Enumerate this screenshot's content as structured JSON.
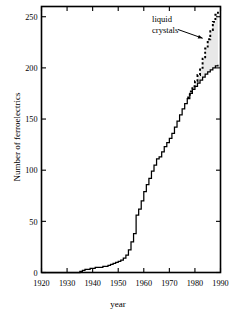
{
  "figure": {
    "ylabel": "Number of ferroelectrics",
    "xlabel": "year"
  },
  "annotations": {
    "liquid_crystals_line1": "liquid",
    "liquid_crystals_line2": "crystals"
  },
  "chart_data": {
    "type": "line",
    "title": "",
    "xlabel": "year",
    "ylabel": "Number of ferroelectrics",
    "xlim": [
      1920,
      1990
    ],
    "ylim": [
      0,
      260
    ],
    "xticks": [
      1920,
      1930,
      1940,
      1950,
      1960,
      1970,
      1980,
      1990
    ],
    "xtick_labels": [
      "1920",
      "1930",
      "1940",
      "1950",
      "1960",
      "1970",
      "1980",
      "1990"
    ],
    "yticks": [
      0,
      50,
      100,
      150,
      200,
      250
    ],
    "ytick_labels": [
      "0",
      "50",
      "100",
      "150",
      "200",
      "250"
    ],
    "grid": false,
    "legend": false,
    "tick_direction": "in",
    "step_style": "post",
    "shaded_region": {
      "between": [
        "ferroelectrics",
        "ferroelectrics_plus_liquid_crystals"
      ],
      "color": "#e8e8e8",
      "from_year": 1977
    },
    "series": [
      {
        "name": "ferroelectrics",
        "style": "solid",
        "color": "#000000",
        "x": [
          1920,
          1934,
          1935,
          1936,
          1937,
          1938,
          1939,
          1940,
          1941,
          1942,
          1943,
          1944,
          1945,
          1946,
          1947,
          1948,
          1949,
          1950,
          1951,
          1952,
          1953,
          1954,
          1955,
          1956,
          1957,
          1958,
          1959,
          1960,
          1961,
          1962,
          1963,
          1964,
          1965,
          1966,
          1967,
          1968,
          1969,
          1970,
          1971,
          1972,
          1973,
          1974,
          1975,
          1976,
          1977,
          1978,
          1979,
          1980,
          1981,
          1982,
          1983,
          1984,
          1985,
          1986,
          1987,
          1988,
          1989
        ],
        "values": [
          0,
          0,
          1,
          2,
          3,
          3,
          4,
          4,
          5,
          5,
          5,
          6,
          6,
          7,
          8,
          9,
          10,
          11,
          12,
          14,
          17,
          22,
          30,
          38,
          56,
          62,
          70,
          79,
          86,
          92,
          99,
          105,
          111,
          113,
          118,
          123,
          127,
          131,
          136,
          142,
          148,
          154,
          160,
          165,
          170,
          175,
          179,
          182,
          185,
          188,
          191,
          194,
          196,
          198,
          200,
          202,
          203
        ]
      },
      {
        "name": "ferroelectrics_plus_liquid_crystals",
        "style": "dotted",
        "color": "#000000",
        "x": [
          1977,
          1978,
          1979,
          1980,
          1981,
          1982,
          1983,
          1984,
          1985,
          1986,
          1987,
          1988,
          1989
        ],
        "values": [
          171,
          177,
          182,
          187,
          193,
          200,
          209,
          219,
          228,
          237,
          245,
          252,
          257
        ]
      }
    ],
    "annotations": [
      {
        "text": "liquid crystals",
        "x": 1974,
        "y": 242,
        "arrow_to_x": 1984,
        "arrow_to_y": 228
      }
    ]
  }
}
